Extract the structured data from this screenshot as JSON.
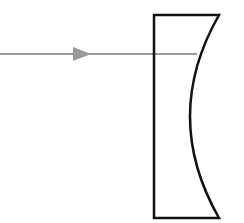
{
  "diagram": {
    "type": "optics",
    "colors": {
      "background": "#ffffff",
      "lens_outline": "#111111",
      "ray": "#9a9a9a"
    },
    "lens": {
      "kind": "plano-concave",
      "flat_side": "left",
      "concave_side": "right",
      "left_x": 154,
      "top_y": 15,
      "bottom_y": 218,
      "right_corner_x": 219,
      "curve_apex_x": 190
    },
    "ray": {
      "y": 54,
      "start_x": 0,
      "end_x": 197,
      "arrow_x": 73,
      "direction": "right"
    }
  }
}
